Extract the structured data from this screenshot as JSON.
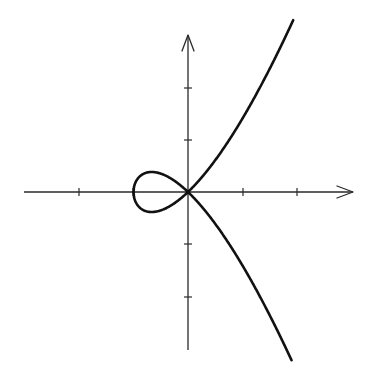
{
  "chart_data": {
    "type": "line",
    "title": "",
    "xlabel": "",
    "ylabel": "",
    "grid": false,
    "legend": null,
    "tick_labels_shown": false,
    "observed": {
      "x_axis_ticks_units": [
        -3,
        -2,
        -1,
        1,
        2
      ],
      "y_axis_ticks_units": [
        -2,
        -1,
        1,
        2
      ],
      "x_range_visible": [
        -3,
        3
      ],
      "y_range_visible": [
        -3,
        3
      ],
      "arrows": [
        "x-positive",
        "y-positive"
      ],
      "loop_leftmost_point": [
        -1,
        0
      ],
      "node_at_origin": true,
      "upper_branch_end": [
        1.93,
        3.23
      ],
      "lower_branch_end": [
        1.9,
        -3.23
      ]
    },
    "fitted_model": {
      "note": "Inferred from the drawn shape (nodal cubic); no equation or labels appear in the image.",
      "equation": "y^2 = x^2 (x + 1)",
      "series": [
        {
          "name": "upper branch",
          "formula": "y = x*sqrt(x+1)",
          "x_start": -1,
          "x_end": 1.93
        },
        {
          "name": "lower branch",
          "formula": "y = -x*sqrt(x+1)",
          "x_start": -1,
          "x_end": 1.9
        }
      ],
      "sample_points": {
        "x": [
          -1,
          -0.75,
          -0.667,
          -0.5,
          -0.25,
          0,
          0.5,
          1,
          1.5,
          1.93
        ],
        "y_upper": [
          0,
          -0.375,
          -0.385,
          -0.354,
          -0.217,
          0,
          0.612,
          1.414,
          2.372,
          3.3
        ]
      }
    }
  },
  "layout": {
    "origin_px": [
      188,
      192
    ],
    "px_per_unit_x": 54.5,
    "px_per_unit_y": 52,
    "x_axis_px": [
      24,
      353
    ],
    "y_axis_px": [
      35,
      350
    ],
    "x_tick_px": [
      79,
      133,
      243,
      297
    ],
    "y_tick_px": [
      88,
      140,
      244,
      297
    ],
    "colors": {
      "axis": "#2a2a2a",
      "curve": "#111111",
      "background": "#ffffff"
    }
  }
}
